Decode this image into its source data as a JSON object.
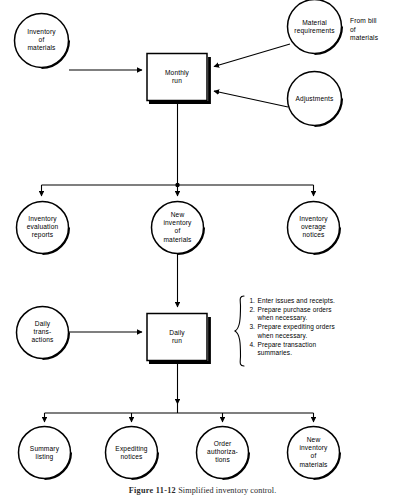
{
  "figure": {
    "caption_prefix": "Figure 11-12",
    "caption_text": "Simplified inventory control.",
    "background_color": "#ffffff",
    "ink_color": "#000000"
  },
  "nodes": {
    "inventory_of_materials": "Inventory\nof\nmaterials",
    "monthly_run": "Monthly\nrun",
    "material_requirements": "Material\nrequirements",
    "adjustments": "Adjustments",
    "inventory_evaluation_reports": "Inventory\nevaluation\nreports",
    "new_inventory_of_materials": "New\ninventory\nof\nmaterials",
    "inventory_overage_notices": "Inventory\noverage\nnotices",
    "daily_transactions": "Daily\ntrans-\nactions",
    "daily_run": "Daily\nrun",
    "summary_listing": "Summary\nlisting",
    "expediting_notices": "Expediting\nnotices",
    "order_authorizations": "Order\nauthoriza-\ntions",
    "new_inventory_of_materials_out": "New\ninventory\nof\nmaterials"
  },
  "annotations": {
    "from_bill_of_materials": "From bill\nof\nmaterials"
  },
  "daily_run_steps": [
    {
      "num": "1.",
      "text": "Enter issues and receipts."
    },
    {
      "num": "2.",
      "text": "Prepare purchase orders\nwhen necessary."
    },
    {
      "num": "3.",
      "text": "Prepare expediting orders\nwhen necessary."
    },
    {
      "num": "4.",
      "text": "Prepare transaction\nsummaries."
    }
  ]
}
